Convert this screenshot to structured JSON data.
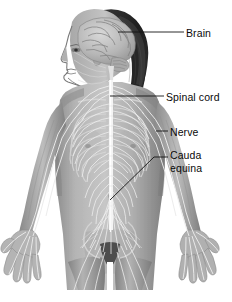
{
  "figure": {
    "background_color": "#ffffff",
    "style": "grayscale-medical-illustration"
  },
  "labels": [
    {
      "id": "brain",
      "text": "Brain",
      "target": "cerebrum"
    },
    {
      "id": "spinal",
      "text": "Spinal cord",
      "target": "spinal-cord"
    },
    {
      "id": "nerve",
      "text": "Nerve",
      "target": "peripheral-nerve"
    },
    {
      "id": "cauda1",
      "text": "Cauda",
      "target": "cauda-equina"
    },
    {
      "id": "cauda2",
      "text": "equina",
      "target": "cauda-equina"
    }
  ],
  "colors": {
    "label_text": "#0a0a0a",
    "leader_line": "#141414",
    "skin_light": "#c9c9c9",
    "skin_mid": "#9a9a9a",
    "skin_dark": "#6e6e6e",
    "hair_dark": "#2a2a2a",
    "nerve_bright": "#f2f2f2",
    "brain_tone": "#b8b8b8"
  }
}
